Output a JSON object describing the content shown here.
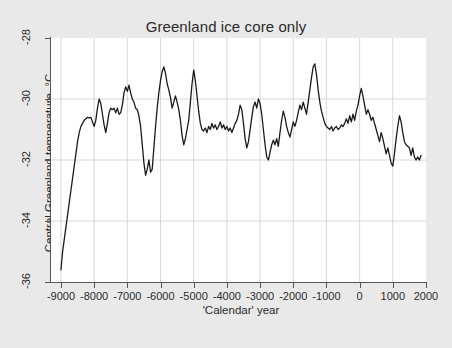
{
  "figure": {
    "background_color": "#e9e9e9",
    "plot_background_color": "#ffffff",
    "axis_color": "#555555",
    "grid_color": "#d8d8d8",
    "line_color": "#1a1a1a"
  },
  "chart_data": {
    "type": "line",
    "title": "Greenland ice core only",
    "subtitle": "",
    "xlabel": "'Calendar' year",
    "ylabel": "Central Greenland temperature, °C",
    "xlim": [
      -9300,
      2000
    ],
    "ylim": [
      -36,
      -28
    ],
    "xticks": [
      -9000,
      -8000,
      -7000,
      -6000,
      -5000,
      -4000,
      -3000,
      -2000,
      -1000,
      0,
      1000,
      2000
    ],
    "xtick_labels": [
      "-9000",
      "-8000",
      "-7000",
      "-6000",
      "-5000",
      "-4000",
      "-3000",
      "-2000",
      "-1000",
      "0",
      "1000",
      "2000"
    ],
    "yticks": [
      -28,
      -30,
      -32,
      -34,
      -36
    ],
    "ytick_labels": [
      "-28",
      "-30",
      "-32",
      "-34",
      "-36"
    ],
    "grid": true,
    "grid_axes": "both",
    "legend": null,
    "legend_position": "none",
    "series": [
      {
        "name": "Central Greenland temperature",
        "x": [
          -9000,
          -8950,
          -8900,
          -8850,
          -8800,
          -8750,
          -8700,
          -8650,
          -8600,
          -8550,
          -8500,
          -8450,
          -8400,
          -8350,
          -8300,
          -8250,
          -8200,
          -8150,
          -8100,
          -8050,
          -8000,
          -7950,
          -7900,
          -7850,
          -7800,
          -7750,
          -7700,
          -7650,
          -7600,
          -7550,
          -7500,
          -7450,
          -7400,
          -7350,
          -7300,
          -7250,
          -7200,
          -7150,
          -7100,
          -7050,
          -7000,
          -6950,
          -6900,
          -6850,
          -6800,
          -6750,
          -6700,
          -6650,
          -6600,
          -6550,
          -6500,
          -6450,
          -6400,
          -6350,
          -6300,
          -6250,
          -6200,
          -6150,
          -6100,
          -6050,
          -6000,
          -5950,
          -5900,
          -5850,
          -5800,
          -5750,
          -5700,
          -5650,
          -5600,
          -5550,
          -5500,
          -5450,
          -5400,
          -5350,
          -5300,
          -5250,
          -5200,
          -5150,
          -5100,
          -5050,
          -5000,
          -4950,
          -4900,
          -4850,
          -4800,
          -4750,
          -4700,
          -4650,
          -4600,
          -4550,
          -4500,
          -4450,
          -4400,
          -4350,
          -4300,
          -4250,
          -4200,
          -4150,
          -4100,
          -4050,
          -4000,
          -3950,
          -3900,
          -3850,
          -3800,
          -3750,
          -3700,
          -3650,
          -3600,
          -3550,
          -3500,
          -3450,
          -3400,
          -3350,
          -3300,
          -3250,
          -3200,
          -3150,
          -3100,
          -3050,
          -3000,
          -2950,
          -2900,
          -2850,
          -2800,
          -2750,
          -2700,
          -2650,
          -2600,
          -2550,
          -2500,
          -2450,
          -2400,
          -2350,
          -2300,
          -2250,
          -2200,
          -2150,
          -2100,
          -2050,
          -2000,
          -1950,
          -1900,
          -1850,
          -1800,
          -1750,
          -1700,
          -1650,
          -1600,
          -1550,
          -1500,
          -1450,
          -1400,
          -1350,
          -1300,
          -1250,
          -1200,
          -1150,
          -1100,
          -1050,
          -1000,
          -950,
          -900,
          -850,
          -800,
          -750,
          -700,
          -650,
          -600,
          -550,
          -500,
          -450,
          -400,
          -350,
          -300,
          -250,
          -200,
          -150,
          -100,
          -50,
          0,
          50,
          100,
          150,
          200,
          250,
          300,
          350,
          400,
          450,
          500,
          550,
          600,
          650,
          700,
          750,
          800,
          850,
          900,
          950,
          1000,
          1050,
          1100,
          1150,
          1200,
          1250,
          1300,
          1350,
          1400,
          1450,
          1500,
          1550,
          1600,
          1650,
          1700,
          1750,
          1800,
          1850
        ],
        "y": [
          -35.6,
          -35.0,
          -34.6,
          -34.2,
          -33.8,
          -33.4,
          -33.0,
          -32.6,
          -32.2,
          -31.8,
          -31.4,
          -31.1,
          -30.9,
          -30.8,
          -30.7,
          -30.65,
          -30.6,
          -30.62,
          -30.6,
          -30.75,
          -30.9,
          -30.7,
          -30.3,
          -30.0,
          -30.15,
          -30.5,
          -30.85,
          -31.1,
          -30.8,
          -30.45,
          -30.3,
          -30.35,
          -30.3,
          -30.45,
          -30.3,
          -30.5,
          -30.45,
          -30.2,
          -29.8,
          -29.6,
          -29.75,
          -29.55,
          -29.8,
          -30.0,
          -30.1,
          -30.3,
          -30.35,
          -30.55,
          -30.9,
          -31.5,
          -32.1,
          -32.5,
          -32.3,
          -32.0,
          -32.4,
          -32.3,
          -31.6,
          -30.9,
          -30.3,
          -29.8,
          -29.4,
          -29.1,
          -28.95,
          -29.15,
          -29.5,
          -29.7,
          -29.95,
          -30.3,
          -30.1,
          -29.9,
          -30.1,
          -30.35,
          -30.7,
          -31.2,
          -31.5,
          -31.3,
          -31.0,
          -30.7,
          -30.1,
          -29.5,
          -29.05,
          -29.4,
          -29.9,
          -30.4,
          -30.8,
          -31.0,
          -31.05,
          -30.95,
          -31.1,
          -30.9,
          -31.0,
          -30.8,
          -30.95,
          -30.85,
          -31.0,
          -30.9,
          -30.75,
          -30.95,
          -30.85,
          -31.0,
          -30.9,
          -31.05,
          -30.95,
          -31.1,
          -30.95,
          -30.8,
          -30.7,
          -30.5,
          -30.2,
          -30.35,
          -30.8,
          -31.3,
          -31.6,
          -31.4,
          -31.0,
          -30.6,
          -30.25,
          -30.1,
          -30.3,
          -30.0,
          -30.15,
          -30.5,
          -31.0,
          -31.5,
          -31.9,
          -32.0,
          -31.75,
          -31.5,
          -31.35,
          -31.5,
          -31.3,
          -31.55,
          -31.1,
          -30.7,
          -30.4,
          -30.6,
          -30.9,
          -31.1,
          -31.25,
          -31.0,
          -30.75,
          -30.9,
          -30.7,
          -30.45,
          -30.2,
          -30.35,
          -30.1,
          -30.3,
          -30.5,
          -30.1,
          -29.7,
          -29.3,
          -28.95,
          -28.85,
          -29.2,
          -29.7,
          -30.1,
          -30.4,
          -30.6,
          -30.8,
          -30.9,
          -30.95,
          -31.0,
          -30.9,
          -31.05,
          -30.95,
          -30.9,
          -31.0,
          -30.95,
          -30.85,
          -30.9,
          -30.8,
          -30.65,
          -30.8,
          -30.55,
          -30.75,
          -30.5,
          -30.7,
          -30.4,
          -30.2,
          -29.9,
          -29.65,
          -29.9,
          -30.2,
          -30.5,
          -30.35,
          -30.5,
          -30.7,
          -30.6,
          -30.8,
          -31.0,
          -31.2,
          -31.4,
          -31.1,
          -31.3,
          -31.55,
          -31.8,
          -31.6,
          -31.85,
          -32.1,
          -32.2,
          -31.8,
          -31.3,
          -30.9,
          -30.55,
          -30.75,
          -31.1,
          -31.4,
          -31.5,
          -31.55,
          -31.6,
          -31.85,
          -31.6,
          -31.9,
          -32.0,
          -31.9,
          -32.0,
          -31.85
        ]
      }
    ]
  }
}
